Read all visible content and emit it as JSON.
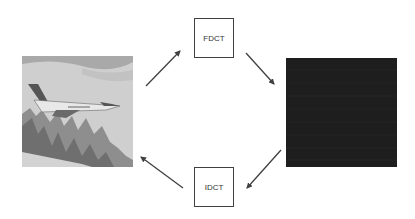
{
  "diagram": {
    "title": "",
    "nodes": [
      {
        "id": "original-image",
        "type": "image",
        "description": "grayscale photo of a fighter jet flying over snowy mountains"
      },
      {
        "id": "fdct",
        "type": "process",
        "label": "FDCT"
      },
      {
        "id": "dct-coefficients",
        "type": "image",
        "description": "dark DCT coefficient image"
      },
      {
        "id": "idct",
        "type": "process",
        "label": "IDCT"
      }
    ],
    "edges": [
      {
        "from": "original-image",
        "to": "fdct"
      },
      {
        "from": "fdct",
        "to": "dct-coefficients"
      },
      {
        "from": "dct-coefficients",
        "to": "idct"
      },
      {
        "from": "idct",
        "to": "original-image"
      }
    ],
    "colors": {
      "background": "#ffffff",
      "arrow": "#404040",
      "box_border": "#404040",
      "dct_image": "#1c1c1c"
    }
  }
}
